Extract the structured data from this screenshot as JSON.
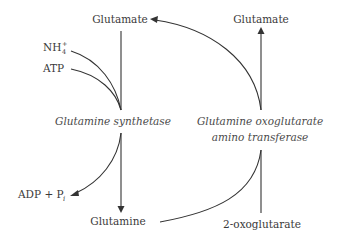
{
  "diagram": {
    "title": "",
    "nodes": {
      "glutamate_left": "Glutamate",
      "glutamate_right": "Glutamate",
      "nh4": "NH",
      "nh4_sub": "4",
      "nh4_sup": "+",
      "atp": "ATP",
      "adp": "ADP + P",
      "adp_sub": "i",
      "glutamine": "Glutamine",
      "oxoglutarate": "2-oxoglutarate"
    },
    "enzymes": {
      "synthetase": "Glutamine synthetase",
      "transferase_line1": "Glutamine oxoglutarate",
      "transferase_line2": "amino transferase"
    },
    "edges": [
      {
        "from": "Glutamate",
        "to": "Glutamine synthetase",
        "type": "line"
      },
      {
        "from": "NH4+",
        "to": "Glutamine synthetase",
        "type": "line"
      },
      {
        "from": "ATP",
        "to": "Glutamine synthetase",
        "type": "line"
      },
      {
        "from": "Glutamine synthetase",
        "to": "Glutamine",
        "type": "arrow"
      },
      {
        "from": "Glutamine synthetase",
        "to": "ADP + Pi",
        "type": "arrow"
      },
      {
        "from": "Glutamine",
        "to": "Glutamine oxoglutarate amino transferase",
        "type": "line"
      },
      {
        "from": "2-oxoglutarate",
        "to": "Glutamine oxoglutarate amino transferase",
        "type": "line"
      },
      {
        "from": "Glutamine oxoglutarate amino transferase",
        "to": "Glutamate (right)",
        "type": "arrow"
      },
      {
        "from": "Glutamine oxoglutarate amino transferase",
        "to": "Glutamate (left)",
        "type": "arrow"
      }
    ]
  }
}
